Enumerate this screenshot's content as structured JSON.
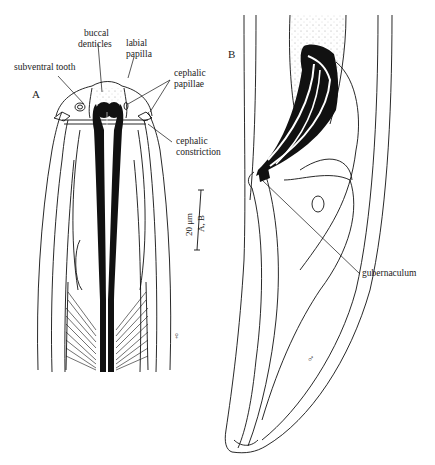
{
  "figure": {
    "panels": [
      {
        "id": "A",
        "label": "A",
        "sex_symbol": "♀",
        "annotations": {
          "buccal_denticles": "buccal\ndenticles",
          "buccal_line1": "buccal",
          "buccal_line2": "denticles",
          "labial_line1": "labial",
          "labial_line2": "papilla",
          "subventral_tooth": "subventral tooth",
          "cephalic_papillae_line1": "cephalic",
          "cephalic_papillae_line2": "papillae",
          "cephalic_constriction_line1": "cephalic",
          "cephalic_constriction_line2": "constriction"
        }
      },
      {
        "id": "B",
        "label": "B",
        "sex_symbol": "♂",
        "annotations": {
          "gubernaculum": "gubernaculum"
        }
      }
    ],
    "scale_bar": {
      "value": "20 μm",
      "applies_to": "A, B"
    },
    "colors": {
      "ink": "#111111",
      "background": "#ffffff",
      "stipple": "#888888"
    }
  }
}
